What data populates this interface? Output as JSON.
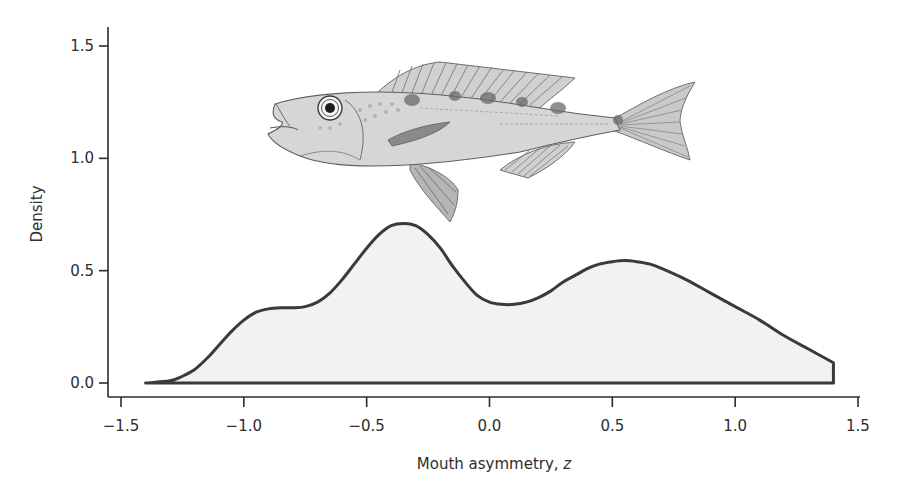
{
  "chart_data": {
    "type": "area",
    "title": "",
    "xlabel": "Mouth asymmetry, ",
    "xlabel_italic": "z",
    "ylabel": "Density",
    "xlim": [
      -1.5,
      1.5
    ],
    "ylim": [
      0.0,
      1.5
    ],
    "x_ticks": [
      -1.5,
      -1.0,
      -0.5,
      0.0,
      0.5,
      1.0,
      1.5
    ],
    "x_tick_labels": [
      "−1.5",
      "−1.0",
      "−0.5",
      "0.0",
      "0.5",
      "1.0",
      "1.5"
    ],
    "y_ticks": [
      0.0,
      0.5,
      1.0,
      1.5
    ],
    "y_tick_labels": [
      "0.0",
      "0.5",
      "1.0",
      "1.5"
    ],
    "grid": false,
    "legend": null,
    "fill_color": "#f2f2f2",
    "line_color": "#3a3a3a",
    "series": [
      {
        "name": "density",
        "x": [
          -1.4,
          -1.3,
          -1.25,
          -1.2,
          -1.15,
          -1.1,
          -1.05,
          -1.0,
          -0.95,
          -0.9,
          -0.85,
          -0.8,
          -0.75,
          -0.7,
          -0.65,
          -0.6,
          -0.55,
          -0.5,
          -0.45,
          -0.4,
          -0.35,
          -0.3,
          -0.25,
          -0.2,
          -0.15,
          -0.1,
          -0.05,
          0.0,
          0.05,
          0.1,
          0.15,
          0.2,
          0.25,
          0.3,
          0.35,
          0.4,
          0.45,
          0.5,
          0.55,
          0.6,
          0.65,
          0.7,
          0.8,
          0.9,
          1.0,
          1.1,
          1.2,
          1.3,
          1.4
        ],
        "y": [
          0.0,
          0.01,
          0.03,
          0.06,
          0.11,
          0.17,
          0.23,
          0.28,
          0.315,
          0.33,
          0.335,
          0.335,
          0.34,
          0.36,
          0.4,
          0.46,
          0.53,
          0.6,
          0.66,
          0.7,
          0.71,
          0.7,
          0.66,
          0.6,
          0.52,
          0.45,
          0.39,
          0.36,
          0.35,
          0.35,
          0.36,
          0.38,
          0.41,
          0.45,
          0.48,
          0.51,
          0.53,
          0.54,
          0.545,
          0.54,
          0.53,
          0.51,
          0.46,
          0.4,
          0.34,
          0.28,
          0.21,
          0.15,
          0.09
        ]
      }
    ],
    "annotations": [
      {
        "type": "image",
        "description": "fish illustration (cichlid) above the density curve"
      }
    ]
  }
}
